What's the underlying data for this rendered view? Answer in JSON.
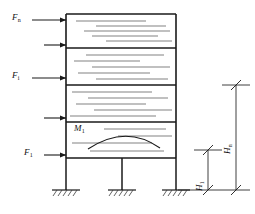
{
  "figure": {
    "type": "structural-frame-lateral-load-diagram"
  },
  "force_labels": {
    "top": {
      "symbol": "F",
      "sub": "n",
      "text": "Fn"
    },
    "mid": {
      "symbol": "F",
      "sub": "i",
      "text": "Fi"
    },
    "bottom": {
      "symbol": "F",
      "sub": "1",
      "text": "F1"
    }
  },
  "moment_label": {
    "symbol": "M",
    "sub": "1",
    "text": "M1"
  },
  "height_labels": {
    "total": {
      "symbol": "H",
      "sub": "n",
      "text": "Hn"
    },
    "first": {
      "symbol": "H",
      "sub": "1",
      "text": "H1"
    }
  },
  "colors": {
    "line": "#1a1a1a",
    "hatch": "#5a5a5a",
    "background": "#ffffff",
    "dimension": "#2a2a2a"
  },
  "frame": {
    "left_x": 66,
    "right_x": 176,
    "top_y": 14,
    "base_y": 190,
    "storey_lines_y": [
      14,
      48,
      85,
      122,
      158
    ],
    "mid_column_x": 122,
    "support_count": 3
  },
  "forces": [
    {
      "name": "F_n",
      "y": 20,
      "arrow_from_x": 32,
      "arrow_to_x": 66,
      "labelled": true
    },
    {
      "name": "unlabelled-1",
      "y": 45,
      "arrow_from_x": 44,
      "arrow_to_x": 66,
      "labelled": false
    },
    {
      "name": "F_i",
      "y": 78,
      "arrow_from_x": 32,
      "arrow_to_x": 66,
      "labelled": true
    },
    {
      "name": "unlabelled-2",
      "y": 118,
      "arrow_from_x": 44,
      "arrow_to_x": 66,
      "labelled": false
    },
    {
      "name": "F_1",
      "y": 155,
      "arrow_from_x": 44,
      "arrow_to_x": 66,
      "labelled": true
    }
  ],
  "dimensions": {
    "Hn": {
      "x": 236,
      "top_y": 85,
      "bottom_y": 190
    },
    "H1": {
      "x": 208,
      "top_y": 150,
      "bottom_y": 190
    }
  }
}
